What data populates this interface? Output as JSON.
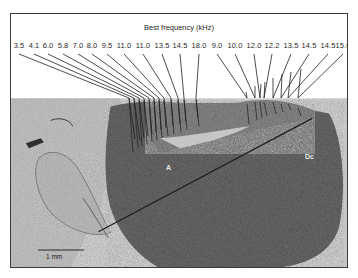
{
  "figure": {
    "title": "Best frequency (kHz)",
    "frequency_labels_left": [
      "3.5",
      "4.1",
      "6.0",
      "5.8",
      "7.0",
      "8.0",
      "9.5",
      "11.0",
      "11.0",
      "13.5",
      "14.5",
      "18.0"
    ],
    "frequency_labels_right": [
      "9.0",
      "10.0",
      "12.0",
      "12.2",
      "13.5",
      "14.5",
      "14.5",
      "15.0"
    ],
    "scale_bar": {
      "label": "1 mm"
    },
    "region_labels": {
      "a": "A",
      "dc": "Dc"
    },
    "colors": {
      "frame": "#3a3a3a",
      "leader_lines": "#1e1e1e",
      "tissue_dark": "#3c3c3c",
      "tissue_mid": "#7a7a7a",
      "background_tissue": "#b8b8b8"
    }
  }
}
